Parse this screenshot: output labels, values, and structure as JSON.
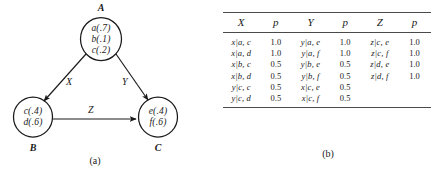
{
  "figure": {
    "panel_a_caption": "(a)",
    "panel_b_caption": "(b)"
  },
  "graph": {
    "nodes": [
      {
        "id": "A",
        "caption": "A",
        "entries": [
          "a(.7)",
          "b(.1)",
          "c(.2)"
        ]
      },
      {
        "id": "B",
        "caption": "B",
        "entries": [
          "c(.4)",
          "d(.6)"
        ]
      },
      {
        "id": "C",
        "caption": "C",
        "entries": [
          "e(.4)",
          "f(.6)"
        ]
      }
    ],
    "edges": [
      {
        "id": "AB",
        "label": "X"
      },
      {
        "id": "AC",
        "label": "Y"
      },
      {
        "id": "BC",
        "label": "Z"
      }
    ]
  },
  "table": {
    "headers": [
      "X",
      "p",
      "Y",
      "p",
      "Z",
      "p"
    ],
    "rows": [
      [
        "x|a, c",
        "1.0",
        "y|a, e",
        "1.0",
        "z|c, e",
        "1.0"
      ],
      [
        "x|a, d",
        "1.0",
        "y|a, f",
        "1.0",
        "z|c, f",
        "1.0"
      ],
      [
        "x|b, c",
        "0.5",
        "y|b, e",
        "0.5",
        "z|d, e",
        "1.0"
      ],
      [
        "x|b, d",
        "0.5",
        "y|b, f",
        "0.5",
        "z|d, f",
        "1.0"
      ],
      [
        "y|c, c",
        "0.5",
        "x|c, e",
        "0.5",
        "",
        ""
      ],
      [
        "y|c, d",
        "0.5",
        "x|c, f",
        "0.5",
        "",
        ""
      ]
    ]
  },
  "colors": {
    "ink": "#1a1a1a",
    "rule": "#4a4a4a",
    "background": "#ffffff"
  }
}
